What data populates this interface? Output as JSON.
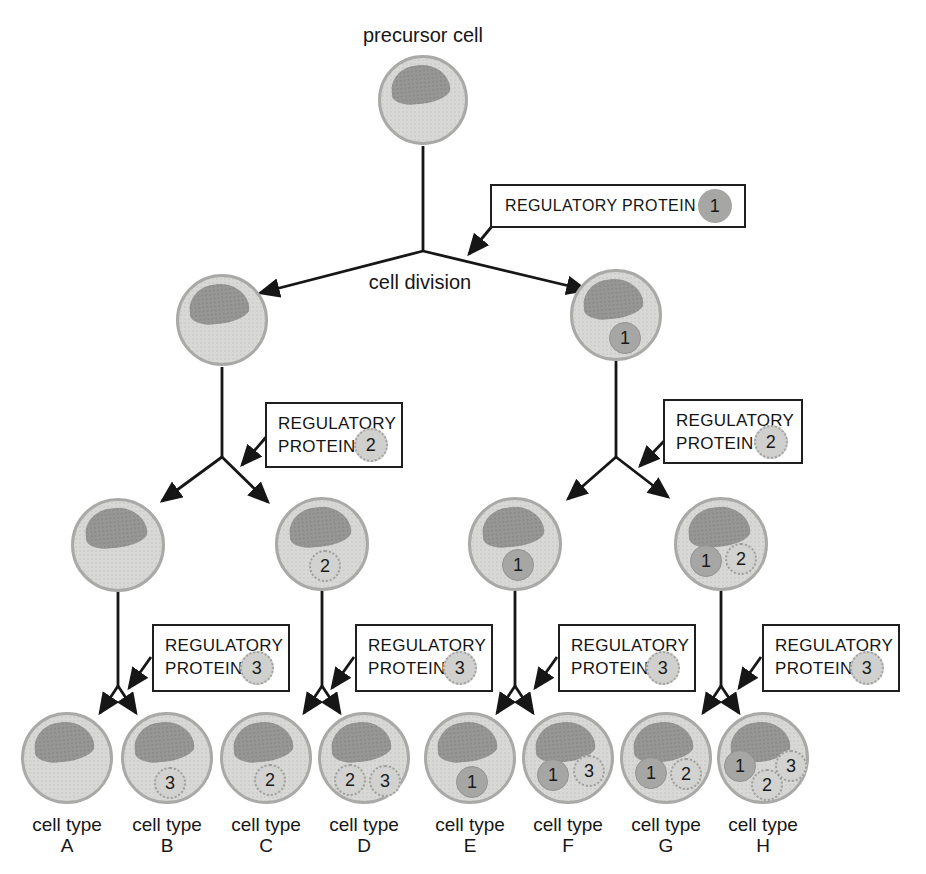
{
  "figure": {
    "precursor_label": "precursor cell",
    "cell_division_label": "cell division",
    "cell_type_prefix": "cell type"
  },
  "boxes": {
    "rp1": {
      "text": "REGULATORY PROTEIN",
      "number": "1"
    },
    "rp2_left": {
      "line1": "REGULATORY",
      "line2": "PROTEIN",
      "number": "2"
    },
    "rp2_right": {
      "line1": "REGULATORY",
      "line2": "PROTEIN",
      "number": "2"
    },
    "rp3_a": {
      "line1": "REGULATORY",
      "line2": "PROTEIN",
      "number": "3"
    },
    "rp3_b": {
      "line1": "REGULATORY",
      "line2": "PROTEIN",
      "number": "3"
    },
    "rp3_c": {
      "line1": "REGULATORY",
      "line2": "PROTEIN",
      "number": "3"
    },
    "rp3_d": {
      "line1": "REGULATORY",
      "line2": "PROTEIN",
      "number": "3"
    }
  },
  "cells": {
    "precursor": {
      "proteins": []
    },
    "level2": [
      {
        "position": "left",
        "proteins": []
      },
      {
        "position": "right",
        "proteins": [
          "1"
        ]
      }
    ],
    "level3": [
      {
        "proteins": []
      },
      {
        "proteins": [
          "2"
        ]
      },
      {
        "proteins": [
          "1"
        ]
      },
      {
        "proteins": [
          "1",
          "2"
        ]
      }
    ],
    "level4": [
      {
        "letter": "A",
        "proteins": []
      },
      {
        "letter": "B",
        "proteins": [
          "3"
        ]
      },
      {
        "letter": "C",
        "proteins": [
          "2"
        ]
      },
      {
        "letter": "D",
        "proteins": [
          "2",
          "3"
        ]
      },
      {
        "letter": "E",
        "proteins": [
          "1"
        ]
      },
      {
        "letter": "F",
        "proteins": [
          "1",
          "3"
        ]
      },
      {
        "letter": "G",
        "proteins": [
          "1",
          "2"
        ]
      },
      {
        "letter": "H",
        "proteins": [
          "1",
          "2",
          "3"
        ]
      }
    ]
  },
  "colors": {
    "background": "#ffffff",
    "cell_fill": "#d8d8d6",
    "cell_border": "#a9a9a7",
    "nucleus": "#979795",
    "protein_1": "#a6a6a4",
    "protein_2_3": "#d0d0ce",
    "line": "#161616",
    "box_border": "#1f1f1f"
  }
}
